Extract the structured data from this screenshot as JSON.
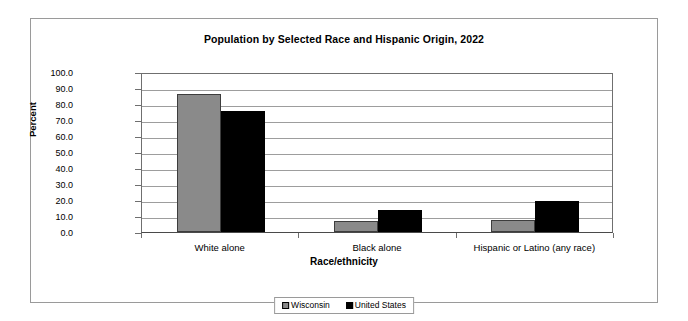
{
  "chart_data": {
    "type": "bar",
    "title": "Population by Selected Race and Hispanic Origin, 2022",
    "xlabel": "Race/ethnicity",
    "ylabel": "Percent",
    "categories": [
      "White alone",
      "Black alone",
      "Hispanic or Latino (any race)"
    ],
    "series": [
      {
        "name": "Wisconsin",
        "color": "#8a8a8a",
        "values": [
          86.0,
          6.8,
          7.8
        ]
      },
      {
        "name": "United States",
        "color": "#000000",
        "values": [
          75.5,
          13.6,
          19.1
        ]
      }
    ],
    "ylim": [
      0.0,
      100.0
    ],
    "ytick_labels": [
      "100.0",
      "90.0",
      "80.0",
      "70.0",
      "60.0",
      "50.0",
      "40.0",
      "30.0",
      "20.0",
      "10.0",
      "0.0"
    ],
    "ytick_values": [
      100,
      90,
      80,
      70,
      60,
      50,
      40,
      30,
      20,
      10,
      0
    ],
    "grid": true,
    "legend_position": "bottom"
  },
  "legend": {
    "items": [
      {
        "label": "Wisconsin",
        "swatch": "gray"
      },
      {
        "label": "United States",
        "swatch": "black"
      }
    ]
  }
}
